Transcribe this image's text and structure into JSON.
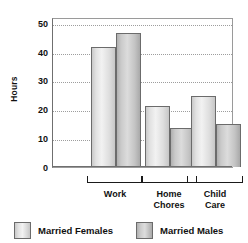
{
  "chart_data": {
    "type": "bar",
    "title": "",
    "xlabel": "",
    "ylabel": "Hours",
    "ylim": [
      0,
      52
    ],
    "yticks": [
      0,
      10,
      20,
      30,
      40,
      50
    ],
    "ytick_labels": [
      "0",
      "10",
      "20",
      "30",
      "40",
      "50"
    ],
    "grid": "horizontal-dotted",
    "legend_position": "bottom",
    "categories": [
      "Work",
      "Home Chores",
      "Child Care"
    ],
    "category_labels": [
      [
        "Work"
      ],
      [
        "Home",
        "Chores"
      ],
      [
        "Child",
        "Care"
      ]
    ],
    "series": [
      {
        "name": "Married Females",
        "color": "#e2e2e2",
        "values": [
          41.5,
          21,
          24.5
        ]
      },
      {
        "name": "Married Males",
        "color": "#c3c3c3",
        "values": [
          46.5,
          13.5,
          15
        ]
      }
    ]
  },
  "legend": {
    "items": [
      {
        "label": "Married Females"
      },
      {
        "label": "Married Males"
      }
    ]
  }
}
